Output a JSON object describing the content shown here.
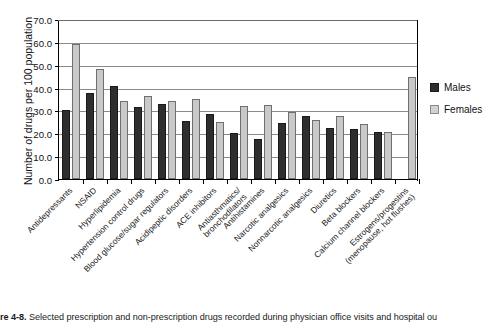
{
  "figure": {
    "caption_label": "re 4-8.",
    "caption_text": "Selected prescription and non-prescription drugs recorded during physician office visits and hospital ou"
  },
  "legend": {
    "position": "right",
    "entries": [
      {
        "label": "Males",
        "color": "#2e2e2e"
      },
      {
        "label": "Females",
        "color": "#c9c9c9"
      }
    ]
  },
  "axes": {
    "ylabel": "Number of drugs per 100 population",
    "yticks": [
      "0.0",
      "10.0",
      "20.0",
      "30.0",
      "40.0",
      "50.0",
      "60.0",
      "70.0"
    ]
  },
  "chart_data": {
    "type": "bar",
    "title": "",
    "xlabel": "",
    "ylabel": "Number of drugs per 100 population",
    "ylim": [
      0,
      70
    ],
    "ytick_values": [
      0,
      10,
      20,
      30,
      40,
      50,
      60,
      70
    ],
    "grid": true,
    "legend_position": "right",
    "categories": [
      "Antidepressants",
      "NSAID",
      "Hyperlipidemia",
      "Hypertension control drugs",
      "Blood glucose/sugar regulators",
      "Acidipeptic disorders",
      "ACE inhibitors",
      "Antiasthmatics/ bronchodilators",
      "Antihistamines",
      "Narcotic analgesics",
      "Nonnarcotic analgesics",
      "Diuretics",
      "Beta blockers",
      "Calcium channel blockers",
      "Estrogens/progestins (menopause, hot flushes)"
    ],
    "category_lines": [
      [
        "Antidepressants"
      ],
      [
        "NSAID"
      ],
      [
        "Hyperlipidemia"
      ],
      [
        "Hypertension control drugs"
      ],
      [
        "Blood glucose/sugar regulators"
      ],
      [
        "Acidipeptic disorders"
      ],
      [
        "ACE inhibitors"
      ],
      [
        "Antiasthmatics/",
        "bronchodilators"
      ],
      [
        "Antihistamines"
      ],
      [
        "Narcotic analgesics"
      ],
      [
        "Nonnarcotic analgesics"
      ],
      [
        "Diuretics"
      ],
      [
        "Beta blockers"
      ],
      [
        "Calcium channel blockers"
      ],
      [
        "Estrogens/progestins",
        "(menopause, hot flushes)"
      ]
    ],
    "series": [
      {
        "name": "Males",
        "color": "#2e2e2e",
        "values": [
          30.0,
          37.5,
          40.5,
          31.5,
          33.0,
          25.5,
          28.5,
          20.0,
          17.5,
          24.5,
          27.5,
          22.5,
          22.0,
          20.5,
          null
        ]
      },
      {
        "name": "Females",
        "color": "#c9c9c9",
        "values": [
          59.0,
          48.0,
          34.0,
          36.5,
          34.0,
          35.0,
          25.0,
          32.0,
          32.5,
          29.5,
          26.0,
          27.5,
          24.0,
          20.5,
          44.5
        ]
      }
    ]
  }
}
